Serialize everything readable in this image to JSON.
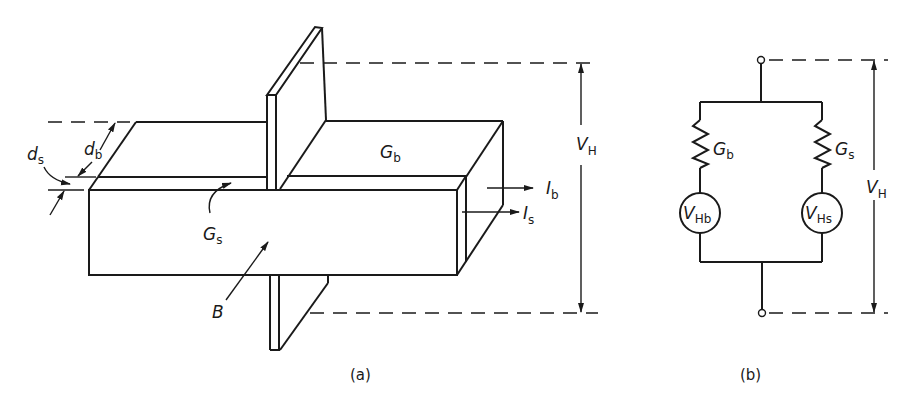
{
  "figure": {
    "panel_a": {
      "caption": "(a)",
      "labels": {
        "d_s": {
          "main": "d",
          "sub": "s"
        },
        "d_b": {
          "main": "d",
          "sub": "b"
        },
        "G_b": {
          "main": "G",
          "sub": "b"
        },
        "G_s": {
          "main": "G",
          "sub": "s"
        },
        "B": {
          "main": "B"
        },
        "I_b": {
          "main": "I",
          "sub": "b"
        },
        "I_s": {
          "main": "I",
          "sub": "s"
        },
        "V_H": {
          "main": "V",
          "sub": "H"
        }
      }
    },
    "panel_b": {
      "caption": "(b)",
      "labels": {
        "G_b": {
          "main": "G",
          "sub": "b"
        },
        "G_s": {
          "main": "G",
          "sub": "s"
        },
        "V_Hb": {
          "main": "V",
          "sub": "Hb"
        },
        "V_Hs": {
          "main": "V",
          "sub": "Hs"
        },
        "V_H": {
          "main": "V",
          "sub": "H"
        }
      }
    }
  }
}
